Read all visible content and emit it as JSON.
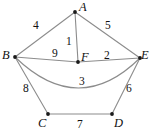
{
  "figure": {
    "background_color": "#ffffff",
    "edge_color": "#8c8c8c",
    "vertex_color": "#1a1a1a",
    "label_color": "#111111"
  },
  "chart_data": {
    "type": "diagram",
    "subtype": "weighted-undirected-graph",
    "title": "",
    "xlabel": "",
    "ylabel": "",
    "nodes": [
      {
        "id": "A",
        "label": "A",
        "x": 75,
        "y": 12,
        "label_x": 79,
        "label_y": 1
      },
      {
        "id": "B",
        "label": "B",
        "x": 15,
        "y": 57,
        "label_x": 2,
        "label_y": 49
      },
      {
        "id": "C",
        "label": "C",
        "x": 48,
        "y": 114,
        "label_x": 38,
        "label_y": 117
      },
      {
        "id": "D",
        "label": "D",
        "x": 112,
        "y": 114,
        "label_x": 114,
        "label_y": 117
      },
      {
        "id": "E",
        "label": "E",
        "x": 140,
        "y": 58,
        "label_x": 141,
        "label_y": 49
      },
      {
        "id": "F",
        "label": "F",
        "x": 78,
        "y": 62,
        "label_x": 81,
        "label_y": 51
      }
    ],
    "edges": [
      {
        "id": "AB",
        "from": "A",
        "to": "B",
        "weight": "4",
        "shape": "straight",
        "label_x": 33,
        "label_y": 20
      },
      {
        "id": "AE",
        "from": "A",
        "to": "E",
        "weight": "5",
        "shape": "straight",
        "label_x": 105,
        "label_y": 20
      },
      {
        "id": "AF",
        "from": "A",
        "to": "F",
        "weight": "1",
        "shape": "straight",
        "label_x": 66,
        "label_y": 36
      },
      {
        "id": "BF",
        "from": "B",
        "to": "F",
        "weight": "9",
        "shape": "straight",
        "label_x": 52,
        "label_y": 48
      },
      {
        "id": "FE",
        "from": "F",
        "to": "E",
        "weight": "2",
        "shape": "straight",
        "label_x": 104,
        "label_y": 50
      },
      {
        "id": "BE",
        "from": "B",
        "to": "E",
        "weight": "3",
        "shape": "curved",
        "curve_x": 78,
        "curve_y": 88,
        "label_x": 79,
        "label_y": 76
      },
      {
        "id": "BC",
        "from": "B",
        "to": "C",
        "weight": "8",
        "shape": "straight",
        "label_x": 23,
        "label_y": 83
      },
      {
        "id": "ED",
        "from": "E",
        "to": "D",
        "weight": "6",
        "shape": "straight",
        "label_x": 126,
        "label_y": 83
      },
      {
        "id": "CD",
        "from": "C",
        "to": "D",
        "weight": "7",
        "shape": "straight",
        "label_x": 77,
        "label_y": 119
      }
    ],
    "weights": [
      "4",
      "5",
      "1",
      "9",
      "2",
      "3",
      "8",
      "6",
      "7"
    ],
    "node_labels": [
      "A",
      "B",
      "C",
      "D",
      "E",
      "F"
    ]
  }
}
